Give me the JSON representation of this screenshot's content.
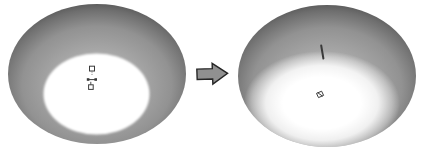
{
  "canvas": {
    "width": 422,
    "height": 150,
    "background": "#ffffff"
  },
  "colors": {
    "shade_center": "#bdbdbd",
    "shade_upper_mid": "#a8a8a8",
    "shade_mid": "#929292",
    "shade_dark": "#6e6e6e",
    "shade_rim_dark": "#565656",
    "light_core": "#ffffff",
    "arrow_fill": "#909090",
    "arrow_outline": "#262626",
    "gizmo_stroke": "#3a3a3a",
    "seam_stroke": "#464646"
  },
  "left_shade": {
    "label": "lampshade-hard-edge-render",
    "outer": {
      "cx": 97,
      "cy": 74,
      "rx": 89,
      "ry": 70
    },
    "inner_light": {
      "cx": 96.5,
      "cy": 94,
      "rx": 53,
      "ry": 40.5
    },
    "seam": {
      "x1": 93.5,
      "y1": 13,
      "x2": 93.5,
      "y2": 53
    },
    "gizmo": {
      "top_square": {
        "x": 89.5,
        "y": 66.2,
        "w": 5,
        "h": 4.8
      },
      "connector": {
        "x1": 92,
        "y1": 71.6,
        "x2": 92,
        "y2": 76.2
      },
      "bar": {
        "x1": 88,
        "y1": 79.6,
        "x2": 96,
        "y2": 79.6
      },
      "bar_end_left": {
        "x": 86.8,
        "y": 78.2,
        "w": 2.6,
        "h": 2.6
      },
      "bar_end_right": {
        "x": 94.4,
        "y": 78.2,
        "w": 2.6,
        "h": 2.6
      },
      "stem": {
        "x1": 90.8,
        "y1": 81.8,
        "x2": 90.8,
        "y2": 84.8
      },
      "bottom_square": {
        "x": 88.6,
        "y": 84.8,
        "w": 4.6,
        "h": 4.6
      }
    }
  },
  "right_shade": {
    "label": "lampshade-soft-glow-render",
    "outer": {
      "cx": 327,
      "cy": 76,
      "rx": 89,
      "ry": 71
    },
    "glow": {
      "cx": 322,
      "cy": 103,
      "rx": 78,
      "ry": 52
    },
    "seam": {
      "x1": 321.2,
      "y1": 45.5,
      "x2": 323.4,
      "y2": 58.5
    },
    "marker": {
      "square_path": "M 316.5 93.4 L 321.6 91.2 L 323.6 95.4 L 318.5 97.6 Z",
      "diagonal": {
        "x1": 317.6,
        "y1": 92.6,
        "x2": 322.6,
        "y2": 96.2
      }
    }
  },
  "arrow": {
    "direction": "right",
    "points": "197,68.6 212.5,68.6 212.5,63.4 227.6,73.9 212.5,84.2 212.5,79 197,79",
    "rotation": "-2 212 74"
  }
}
